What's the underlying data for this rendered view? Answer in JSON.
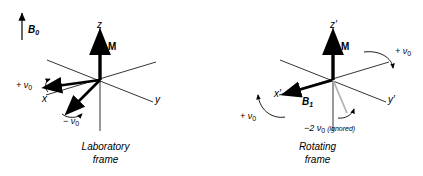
{
  "figure": {
    "background": "#ffffff",
    "stroke_color": "#000000",
    "faint_color": "#b3b3b3"
  },
  "panels": [
    {
      "id": "laboratory",
      "caption_line1": "Laboratory",
      "caption_line2": "frame",
      "field_label": "B",
      "field_sub": "0",
      "magnetization_label": "M",
      "axis_z": "z",
      "axis_x": "x",
      "axis_y": "y",
      "rot_plus": "+",
      "rot_minus": "−",
      "nu_symbol": "ν",
      "nu_sub": "0",
      "plus_nu_label": "+ ν",
      "minus_nu_label": "− ν"
    },
    {
      "id": "rotating",
      "caption_line1": "Rotating",
      "caption_line2": "frame",
      "field_label": "B",
      "field_sub": "1",
      "magnetization_label": "M",
      "axis_z": "z′",
      "axis_x": "x′",
      "axis_y": "y′",
      "nu_symbol": "ν",
      "nu_sub": "0",
      "plus_nu_label_top": "+ ν",
      "plus_nu_label_bottom": "+ ν",
      "minus_two_nu_label": "−2 ν",
      "ignored_note": "(ignored)"
    }
  ]
}
